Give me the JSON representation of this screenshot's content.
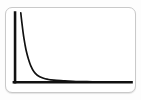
{
  "card": {
    "background_color": "#ffffff",
    "border_color": "#c9c9c9"
  },
  "page": {
    "background_color": "#fdfdfd"
  },
  "chart_data": {
    "type": "line",
    "title": "",
    "subtitle": "",
    "xlabel": "",
    "ylabel": "",
    "xlim": [
      0,
      100
    ],
    "ylim": [
      0,
      100
    ],
    "grid": false,
    "legend": false,
    "legend_position": "none",
    "axis_color": "#111111",
    "line_color": "#111111",
    "tick_labels_x": [],
    "tick_labels_y": [],
    "annotations": [],
    "series": [
      {
        "name": "decay",
        "x": [
          0,
          1,
          2,
          3,
          4,
          5,
          7,
          9,
          12,
          15,
          20,
          25,
          30,
          40,
          50,
          60,
          70,
          80,
          90,
          100
        ],
        "values": [
          100,
          86,
          73,
          62,
          53,
          45,
          33,
          24,
          15,
          10,
          6,
          4,
          3,
          2,
          1,
          1,
          0,
          0,
          0,
          0
        ]
      }
    ]
  }
}
